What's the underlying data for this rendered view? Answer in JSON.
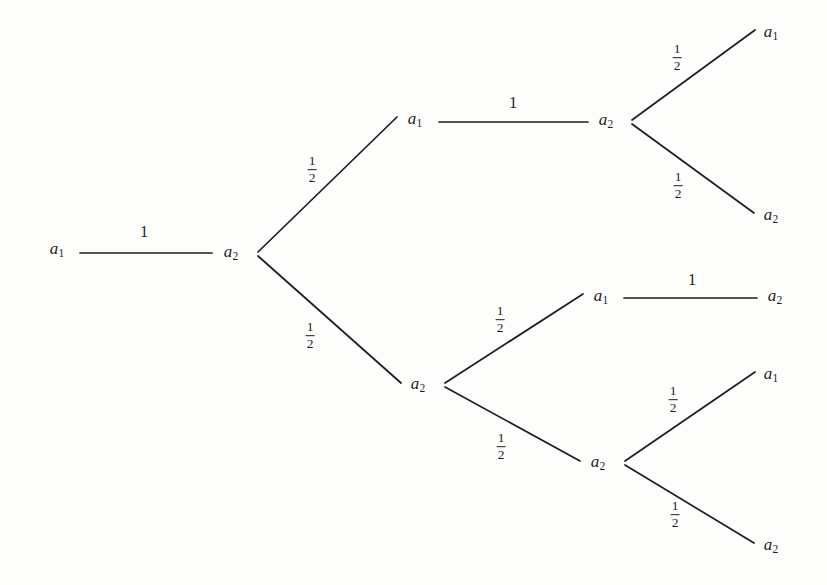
{
  "figure": {
    "type": "game-tree",
    "background_color": "#fdfdfb",
    "line_color": "#1d1d1d",
    "text_color": "#1d1d1d",
    "width": 827,
    "height": 585
  },
  "labels": {
    "a1": "a",
    "a2": "a",
    "sub1": "1",
    "sub2": "2",
    "one": "1",
    "half_num": "1",
    "half_den": "2"
  },
  "nodes": [
    {
      "id": "n0",
      "name": "root-a1",
      "label": "a",
      "sub": "1",
      "x": 57,
      "y": 250
    },
    {
      "id": "n1",
      "name": "level1-a2",
      "label": "a",
      "sub": "2",
      "x": 231,
      "y": 253
    },
    {
      "id": "n2",
      "name": "upper-a1",
      "label": "a",
      "sub": "1",
      "x": 415,
      "y": 120
    },
    {
      "id": "n3",
      "name": "upper-a2",
      "label": "a",
      "sub": "2",
      "x": 606,
      "y": 121
    },
    {
      "id": "n4",
      "name": "upper-leaf-a1",
      "label": "a",
      "sub": "1",
      "x": 771,
      "y": 33
    },
    {
      "id": "n5",
      "name": "upper-leaf-a2",
      "label": "a",
      "sub": "2",
      "x": 771,
      "y": 216
    },
    {
      "id": "n6",
      "name": "lower-a2",
      "label": "a",
      "sub": "2",
      "x": 418,
      "y": 385
    },
    {
      "id": "n7",
      "name": "lower-upper-a1",
      "label": "a",
      "sub": "1",
      "x": 601,
      "y": 297
    },
    {
      "id": "n8",
      "name": "lower-upper-leaf-a2",
      "label": "a",
      "sub": "2",
      "x": 775,
      "y": 297
    },
    {
      "id": "n9",
      "name": "lower-lower-a2",
      "label": "a",
      "sub": "2",
      "x": 598,
      "y": 463
    },
    {
      "id": "n10",
      "name": "lower-leaf-a1",
      "label": "a",
      "sub": "1",
      "x": 771,
      "y": 375
    },
    {
      "id": "n11",
      "name": "lower-leaf-a2",
      "label": "a",
      "sub": "2",
      "x": 771,
      "y": 546
    }
  ],
  "edges": [
    {
      "name": "edge-root-to-level1",
      "from": "n0",
      "to": "n1",
      "x1": 80,
      "y1": 253,
      "x2": 212,
      "y2": 253,
      "prob": "1",
      "label_x": 144,
      "label_y": 232
    },
    {
      "name": "edge-level1-to-upper-a1",
      "from": "n1",
      "to": "n2",
      "x1": 258,
      "y1": 252,
      "x2": 397,
      "y2": 117,
      "prob": "1/2",
      "label_x": 312,
      "label_y": 170
    },
    {
      "name": "edge-level1-to-lower-a2",
      "from": "n1",
      "to": "n6",
      "x1": 258,
      "y1": 256,
      "x2": 401,
      "y2": 383,
      "prob": "1/2",
      "label_x": 310,
      "label_y": 336
    },
    {
      "name": "edge-upper-a1-to-upper-a2",
      "from": "n2",
      "to": "n3",
      "x1": 439,
      "y1": 122,
      "x2": 588,
      "y2": 122,
      "prob": "1",
      "label_x": 513,
      "label_y": 103
    },
    {
      "name": "edge-upper-a2-to-leaf-a1",
      "from": "n3",
      "to": "n4",
      "x1": 632,
      "y1": 120,
      "x2": 755,
      "y2": 30,
      "prob": "1/2",
      "label_x": 677,
      "label_y": 58
    },
    {
      "name": "edge-upper-a2-to-leaf-a2",
      "from": "n3",
      "to": "n5",
      "x1": 632,
      "y1": 124,
      "x2": 754,
      "y2": 213,
      "prob": "1/2",
      "label_x": 678,
      "label_y": 186
    },
    {
      "name": "edge-lower-a2-to-a1",
      "from": "n6",
      "to": "n7",
      "x1": 445,
      "y1": 383,
      "x2": 583,
      "y2": 294,
      "prob": "1/2",
      "label_x": 500,
      "label_y": 320
    },
    {
      "name": "edge-lower-a2-to-a2",
      "from": "n6",
      "to": "n9",
      "x1": 445,
      "y1": 387,
      "x2": 580,
      "y2": 461,
      "prob": "1/2",
      "label_x": 501,
      "label_y": 447
    },
    {
      "name": "edge-lower-a1-to-leaf-a2",
      "from": "n7",
      "to": "n8",
      "x1": 624,
      "y1": 298,
      "x2": 757,
      "y2": 298,
      "prob": "1",
      "label_x": 692,
      "label_y": 280
    },
    {
      "name": "edge-lower-a2-to-leaf-a1",
      "from": "n9",
      "to": "n10",
      "x1": 625,
      "y1": 461,
      "x2": 755,
      "y2": 372,
      "prob": "1/2",
      "label_x": 673,
      "label_y": 400
    },
    {
      "name": "edge-lower-a2-to-leaf-a2",
      "from": "n9",
      "to": "n11",
      "x1": 625,
      "y1": 465,
      "x2": 754,
      "y2": 543,
      "prob": "1/2",
      "label_x": 675,
      "label_y": 515
    }
  ]
}
